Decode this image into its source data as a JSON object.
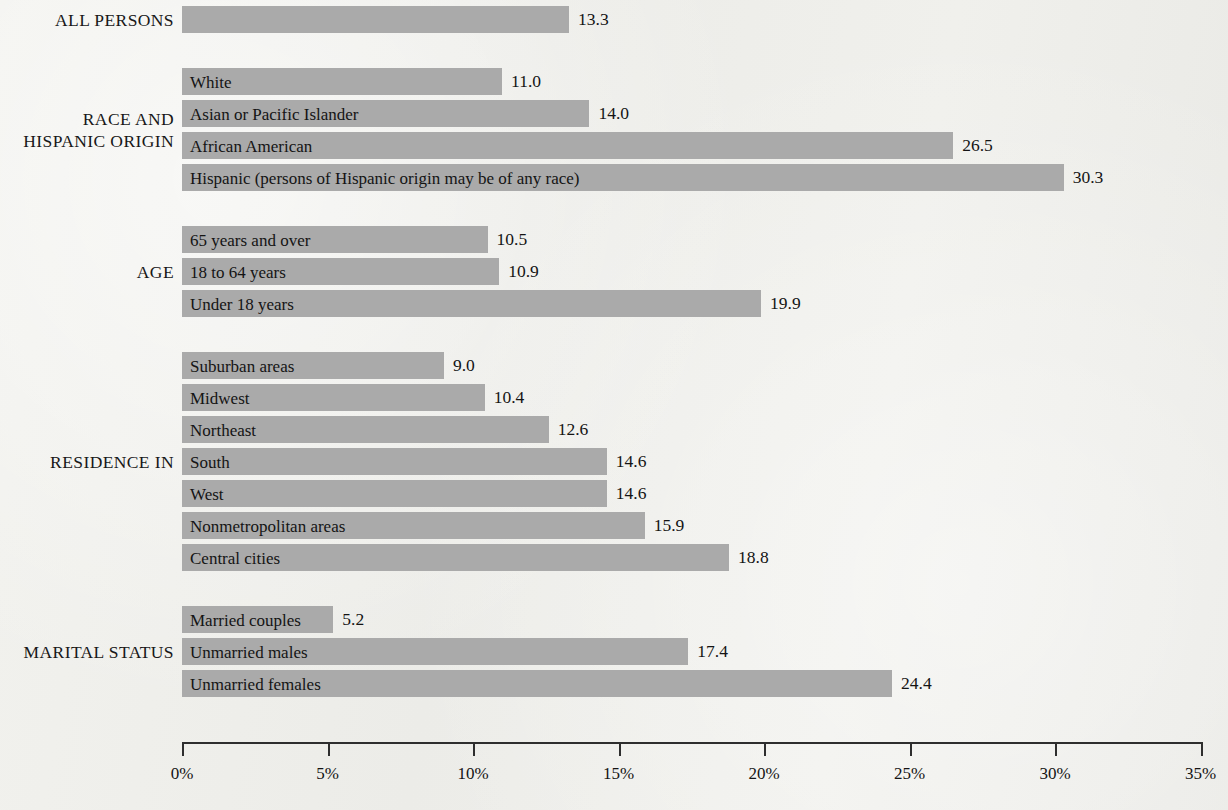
{
  "chart_data": {
    "type": "bar",
    "orientation": "horizontal",
    "title": "",
    "xlabel": "",
    "ylabel": "",
    "xlim": [
      0,
      35
    ],
    "grid": false,
    "legend": false,
    "bar_color": "#aaaaaa",
    "axis_ticks": [
      "0%",
      "5%",
      "10%",
      "15%",
      "20%",
      "25%",
      "30%",
      "35%"
    ],
    "axis_tick_values": [
      0,
      5,
      10,
      15,
      20,
      25,
      30,
      35
    ],
    "groups": [
      {
        "label": "ALL PERSONS",
        "items": [
          {
            "category": "",
            "value": 13.3,
            "value_label": "13.3"
          }
        ]
      },
      {
        "label": "RACE AND\nHISPANIC ORIGIN",
        "items": [
          {
            "category": "White",
            "value": 11.0,
            "value_label": "11.0"
          },
          {
            "category": "Asian or Pacific Islander",
            "value": 14.0,
            "value_label": "14.0"
          },
          {
            "category": "African American",
            "value": 26.5,
            "value_label": "26.5"
          },
          {
            "category": "Hispanic (persons of Hispanic origin may be of any race)",
            "value": 30.3,
            "value_label": "30.3"
          }
        ]
      },
      {
        "label": "AGE",
        "items": [
          {
            "category": "65 years and over",
            "value": 10.5,
            "value_label": "10.5"
          },
          {
            "category": "18 to 64 years",
            "value": 10.9,
            "value_label": "10.9"
          },
          {
            "category": "Under 18 years",
            "value": 19.9,
            "value_label": "19.9"
          }
        ]
      },
      {
        "label": "RESIDENCE IN",
        "items": [
          {
            "category": "Suburban areas",
            "value": 9.0,
            "value_label": "9.0"
          },
          {
            "category": "Midwest",
            "value": 10.4,
            "value_label": "10.4"
          },
          {
            "category": "Northeast",
            "value": 12.6,
            "value_label": "12.6"
          },
          {
            "category": "South",
            "value": 14.6,
            "value_label": "14.6"
          },
          {
            "category": "West",
            "value": 14.6,
            "value_label": "14.6"
          },
          {
            "category": "Nonmetropolitan areas",
            "value": 15.9,
            "value_label": "15.9"
          },
          {
            "category": "Central cities",
            "value": 18.8,
            "value_label": "18.8"
          }
        ]
      },
      {
        "label": "MARITAL STATUS",
        "items": [
          {
            "category": "Married couples",
            "value": 5.2,
            "value_label": "5.2"
          },
          {
            "category": "Unmarried males",
            "value": 17.4,
            "value_label": "17.4"
          },
          {
            "category": "Unmarried females",
            "value": 24.4,
            "value_label": "24.4"
          }
        ]
      }
    ]
  }
}
